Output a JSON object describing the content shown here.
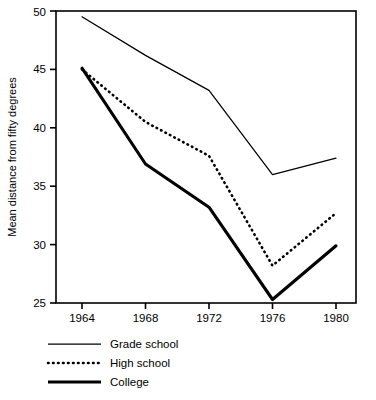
{
  "chart_data": {
    "type": "line",
    "title": "",
    "subtitle": "",
    "xlabel": "",
    "ylabel": "Mean distance from fifty degrees",
    "x": [
      1964,
      1968,
      1972,
      1976,
      1980
    ],
    "categories": [
      "1964",
      "1968",
      "1972",
      "1976",
      "1980"
    ],
    "xlim": [
      1962.7,
      1982.0
    ],
    "ylim": [
      25,
      50
    ],
    "xticks": [
      "1964",
      "1968",
      "1972",
      "1976",
      "1980"
    ],
    "yticks": [
      "25",
      "30",
      "35",
      "40",
      "45",
      "50"
    ],
    "ytick_values": [
      25,
      30,
      35,
      40,
      45,
      50
    ],
    "grid": false,
    "legend_position": "below-left",
    "series": [
      {
        "name": "Grade school",
        "style": "solid-thin",
        "color": "#000000",
        "values": [
          49.5,
          46.2,
          43.2,
          36.0,
          37.4
        ]
      },
      {
        "name": "High school",
        "style": "dotted",
        "color": "#000000",
        "values": [
          45.0,
          40.5,
          37.6,
          28.2,
          32.7
        ]
      },
      {
        "name": "College",
        "style": "solid-thick",
        "color": "#000000",
        "values": [
          45.1,
          36.9,
          33.2,
          25.3,
          29.9
        ]
      }
    ]
  },
  "legend": {
    "items": [
      {
        "label": "Grade school",
        "style": "solid-thin"
      },
      {
        "label": "High school",
        "style": "dotted"
      },
      {
        "label": "College",
        "style": "solid-thick"
      }
    ]
  },
  "axes": {
    "y_title": "Mean distance from fifty degrees",
    "x_tick_labels": [
      "1964",
      "1968",
      "1972",
      "1976",
      "1980"
    ],
    "y_tick_labels": [
      "25",
      "30",
      "35",
      "40",
      "45",
      "50"
    ]
  }
}
